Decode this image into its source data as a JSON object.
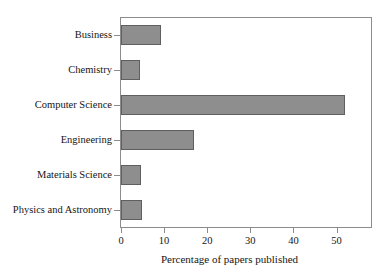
{
  "chart_data": {
    "type": "bar",
    "orientation": "horizontal",
    "title": "",
    "xlabel": "Percentage of papers published",
    "ylabel": "",
    "categories": [
      "Business",
      "Chemistry",
      "Computer Science",
      "Engineering",
      "Materials Science",
      "Physics and Astronomy"
    ],
    "values": [
      9.3,
      4.4,
      52.0,
      17.0,
      4.7,
      4.8
    ],
    "xlim": [
      0,
      58
    ],
    "ylim": [
      0,
      6
    ],
    "xticks": [
      0,
      10,
      20,
      30,
      40,
      50
    ],
    "xticklabels": [
      "0",
      "10",
      "20",
      "30",
      "40",
      "50"
    ],
    "grid": false,
    "legend": null,
    "bar_color": "#8e8e8e",
    "bar_edge_color": "#5f5f5f",
    "frame_color": "#8c8c8c",
    "background": "#ffffff"
  }
}
